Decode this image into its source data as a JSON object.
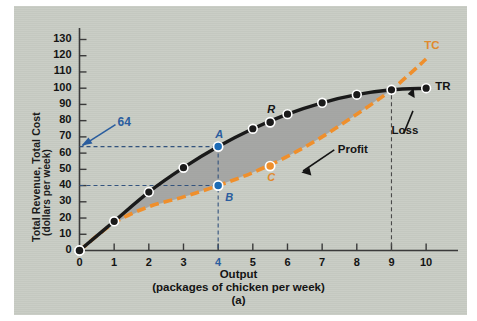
{
  "figure": {
    "panel_bg": "#c8ccc4",
    "sublabel": "(a)"
  },
  "chart_data": {
    "type": "line",
    "title": "",
    "xlabel": "Output",
    "xlabel_units": "(packages of chicken per week)",
    "ylabel": "Total Revenue, Total Cost",
    "ylabel_units": "(dollars per week)",
    "x": [
      0,
      1,
      2,
      3,
      4,
      5,
      6,
      7,
      8,
      9,
      10
    ],
    "xlim": [
      0,
      10.4
    ],
    "ylim": [
      0,
      134
    ],
    "xticks": [
      "0",
      "1",
      "2",
      "3",
      "4",
      "5",
      "6",
      "7",
      "8",
      "9",
      "10"
    ],
    "yticks": [
      "0",
      "10",
      "20",
      "30",
      "40",
      "50",
      "60",
      "70",
      "80",
      "90",
      "100",
      "110",
      "120",
      "130"
    ],
    "grid": false,
    "legend": "inline-curve-labels",
    "series": [
      {
        "name": "TR",
        "label": "TR",
        "color": "#1a1a1a",
        "style": "solid",
        "values": [
          0,
          18,
          36,
          51,
          64,
          75,
          84,
          91,
          96,
          99,
          100
        ]
      },
      {
        "name": "TC",
        "label": "TC",
        "color": "#ef8f2c",
        "style": "dashed",
        "values": [
          0,
          17,
          27,
          33,
          40,
          48,
          58,
          70,
          84,
          99,
          118
        ]
      }
    ],
    "markers": [
      {
        "name": "A",
        "label": "A",
        "x": 4,
        "y": 64,
        "series": "TR",
        "color": "#1c6bb5"
      },
      {
        "name": "B",
        "label": "B",
        "x": 4,
        "y": 40,
        "series": "TC",
        "color": "#1c6bb5"
      },
      {
        "name": "R",
        "label": "R",
        "x": 5.5,
        "y": 79,
        "series": "TR",
        "color": "#1a1a1a"
      },
      {
        "name": "C",
        "label": "C",
        "x": 5.5,
        "y": 52,
        "series": "TC",
        "color": "#ef8f2c"
      }
    ],
    "annotations": [
      {
        "name": "value-64",
        "text": "64",
        "kind": "arrow-callout",
        "color": "#2a5d9e",
        "points_to_y": 64
      },
      {
        "name": "profit-region",
        "text": "Profit",
        "kind": "shaded-area-callout",
        "color": "#141414",
        "region": "between TR and TC from x=1 to x=9"
      },
      {
        "name": "loss-region",
        "text": "Loss",
        "kind": "arrow-callout",
        "color": "#141414",
        "region": "TC above TR beyond x=9"
      }
    ],
    "guides": [
      {
        "name": "guide-y-64",
        "type": "horizontal-dashed",
        "value": 64,
        "color": "#33537d"
      },
      {
        "name": "guide-y-40",
        "type": "horizontal-dashed",
        "value": 40,
        "color": "#33537d"
      },
      {
        "name": "guide-x-4",
        "type": "vertical-dashed",
        "value": 4,
        "color": "#33537d"
      },
      {
        "name": "guide-x-9",
        "type": "vertical-dashed",
        "value": 9,
        "color": "#4a4a4a"
      }
    ],
    "breakeven_x": 9,
    "profit_shading_color": "#9a9a99"
  }
}
